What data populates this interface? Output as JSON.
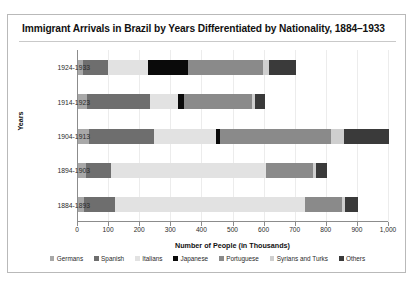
{
  "chart_data": {
    "type": "bar",
    "orientation": "horizontal",
    "stacked": true,
    "title": "Immigrant Arrivals in Brazil by Years Differentiated by Nationality, 1884–1933",
    "xlabel": "Number of People (in Thousands)",
    "ylabel": "Years",
    "xlim": [
      0,
      1000
    ],
    "xticks": [
      0,
      100,
      200,
      300,
      400,
      500,
      600,
      700,
      800,
      900,
      1000
    ],
    "xtick_labels": [
      "0",
      "100",
      "200",
      "300",
      "400",
      "500",
      "600",
      "700",
      "800",
      "900",
      "1,000"
    ],
    "grid": true,
    "legend_position": "bottom",
    "categories": [
      "1924-1933",
      "1914-1923",
      "1904-1913",
      "1894-1903",
      "1884-1893"
    ],
    "series": [
      {
        "name": "Germans",
        "color": "#a8a8a8",
        "values": [
          15,
          30,
          35,
          25,
          20
        ]
      },
      {
        "name": "Spanish",
        "color": "#6e6e6e",
        "values": [
          80,
          200,
          210,
          80,
          100
        ]
      },
      {
        "name": "Italians",
        "color": "#e2e2e2",
        "values": [
          130,
          90,
          200,
          500,
          610
        ]
      },
      {
        "name": "Japanese",
        "color": "#0a0a0a",
        "values": [
          130,
          20,
          10,
          0,
          0
        ]
      },
      {
        "name": "Portuguese",
        "color": "#8a8a8a",
        "values": [
          240,
          220,
          360,
          150,
          120
        ]
      },
      {
        "name": "Syrians and Turks",
        "color": "#cfcfcf",
        "values": [
          20,
          10,
          40,
          10,
          10
        ]
      },
      {
        "name": "Others",
        "color": "#3a3a3a",
        "values": [
          85,
          30,
          145,
          35,
          40
        ]
      }
    ],
    "totals": [
      700,
      600,
      1000,
      800,
      900
    ]
  },
  "legend": {
    "items": [
      {
        "label": "Germans",
        "color": "#a8a8a8",
        "icon": "legend-swatch"
      },
      {
        "label": "Spanish",
        "color": "#6e6e6e",
        "icon": "legend-swatch"
      },
      {
        "label": "Italians",
        "color": "#e2e2e2",
        "icon": "legend-swatch"
      },
      {
        "label": "Japanese",
        "color": "#0a0a0a",
        "icon": "legend-swatch"
      },
      {
        "label": "Portuguese",
        "color": "#8a8a8a",
        "icon": "legend-swatch"
      },
      {
        "label": "Syrians and Turks",
        "color": "#cfcfcf",
        "icon": "legend-swatch"
      },
      {
        "label": "Others",
        "color": "#3a3a3a",
        "icon": "legend-swatch"
      }
    ]
  }
}
